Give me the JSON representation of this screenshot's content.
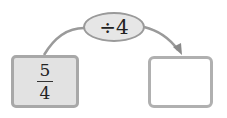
{
  "diagram": {
    "operation": "÷4",
    "input": {
      "numerator": "5",
      "denominator": "4"
    },
    "output": "",
    "colors": {
      "stroke": "#9a9a9a",
      "fill": "#e4e4e4"
    }
  }
}
